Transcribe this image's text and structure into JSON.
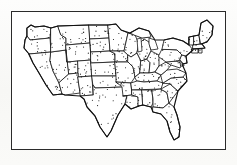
{
  "figure": {
    "caption": "",
    "style": "vintage black-and-white line engraving",
    "background_color": "#fbfbfa",
    "ink_color": "#121212",
    "frame": {
      "present": true,
      "color": "#2b2b2b",
      "x": 11,
      "y": 11,
      "width": 215,
      "height": 139,
      "line_width_px": 1.3
    }
  },
  "map": {
    "region": "Contiguous United States",
    "projection_look": "simple conic / flattened",
    "boundaries_shown": "state borders",
    "symbology": {
      "type": "dot-density",
      "dot_color": "#121212",
      "dot_radius_px": 0.55,
      "dot_count_approx": 430,
      "description": "small uniform black dots scattered across all states"
    },
    "features": {
      "great_lakes_blank": true,
      "florida_peninsula": true,
      "maine_tip": true,
      "texas_panhandle": true,
      "cape_cod": true,
      "national_outline": true
    }
  },
  "chart_data": {
    "type": "map",
    "xlabel": "",
    "ylabel": "",
    "legend": [],
    "categories": [
      "Washington",
      "Oregon",
      "California",
      "Nevada",
      "Idaho",
      "Montana",
      "Wyoming",
      "Utah",
      "Arizona",
      "Colorado",
      "New Mexico",
      "North Dakota",
      "South Dakota",
      "Nebraska",
      "Kansas",
      "Oklahoma",
      "Texas",
      "Minnesota",
      "Iowa",
      "Missouri",
      "Arkansas",
      "Louisiana",
      "Wisconsin",
      "Illinois",
      "Michigan",
      "Indiana",
      "Ohio",
      "Kentucky",
      "Tennessee",
      "Mississippi",
      "Alabama",
      "Georgia",
      "Florida",
      "South Carolina",
      "North Carolina",
      "Virginia",
      "West Virginia",
      "Maryland",
      "Delaware",
      "Pennsylvania",
      "New Jersey",
      "New York",
      "Connecticut",
      "Rhode Island",
      "Massachusetts",
      "Vermont",
      "New Hampshire",
      "Maine"
    ],
    "values": [
      9,
      9,
      14,
      8,
      8,
      14,
      9,
      8,
      9,
      10,
      10,
      8,
      8,
      8,
      9,
      8,
      22,
      10,
      8,
      10,
      7,
      7,
      8,
      8,
      9,
      6,
      7,
      7,
      7,
      6,
      6,
      9,
      10,
      5,
      7,
      6,
      4,
      2,
      1,
      7,
      2,
      9,
      1,
      1,
      2,
      2,
      2,
      6
    ],
    "units": "approximate dots drawn per state"
  }
}
